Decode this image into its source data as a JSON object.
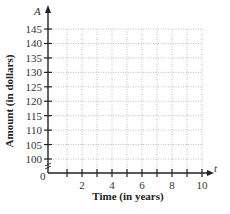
{
  "chart_data": {
    "type": "line",
    "title": "",
    "xlabel": "Time (in years)",
    "ylabel": "Amount (in dollars)",
    "x_axis_variable": "t",
    "y_axis_variable": "A",
    "xlim": [
      0,
      10
    ],
    "ylim": [
      100,
      145
    ],
    "x_ticks": [
      1,
      2,
      3,
      4,
      5,
      6,
      7,
      8,
      9,
      10
    ],
    "x_tick_labels": [
      "2",
      "4",
      "6",
      "8",
      "10"
    ],
    "x_tick_label_values": [
      2,
      4,
      6,
      8,
      10
    ],
    "y_ticks": [
      100,
      105,
      110,
      115,
      120,
      125,
      130,
      135,
      140,
      145
    ],
    "y_tick_labels": [
      "100",
      "105",
      "110",
      "115",
      "120",
      "125",
      "130",
      "135",
      "140",
      "145"
    ],
    "origin_label": "0",
    "axis_break": true,
    "grid": true,
    "grid_style": "dotted",
    "series": []
  },
  "labels": {
    "x_title": "Time (in years)",
    "y_title": "Amount (in dollars)",
    "x_var": "t",
    "y_var": "A",
    "origin": "0"
  },
  "colors": {
    "axis": "#222222",
    "grid": "#b0b0b0",
    "text": "#333333"
  }
}
